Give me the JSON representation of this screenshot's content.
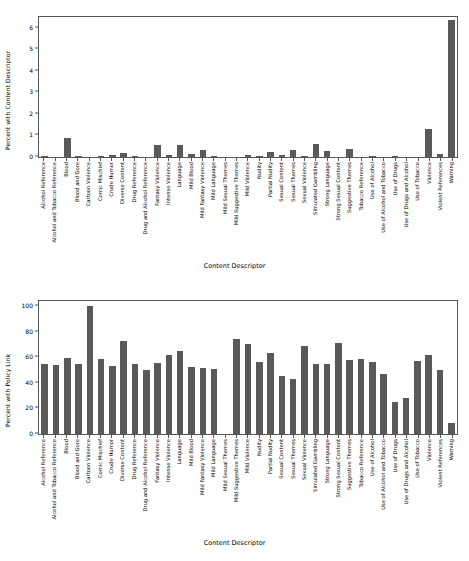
{
  "figure": {
    "categories": [
      "Alcohol Reference",
      "Alcohol and Tobacco Reference",
      "Blood",
      "Blood and Gore",
      "Cartoon Violence",
      "Comic Mischief",
      "Crude Humor",
      "Diverse Content",
      "Drug Reference",
      "Drug and Alcohol Reference",
      "Fantasy Violence",
      "Intense Violence",
      "Language",
      "Mild Blood",
      "Mild Fantasy Violence",
      "Mild Language",
      "Mild Sexual Themes",
      "Mild Suggestive Themes",
      "Mild Violence",
      "Nudity",
      "Partial Nudity",
      "Sexual Content",
      "Sexual Themes",
      "Sexual Violence",
      "Simulated Gambling",
      "Strong Language",
      "Strong Sexual Content",
      "Suggestive Themes",
      "Tobacco Reference",
      "Use of Alcohol",
      "Use of Alcohol and Tobacco",
      "Use of Drugs",
      "Use of Drugs and Alcohol",
      "Use of Tobacco",
      "Violence",
      "Violent References",
      "Warning"
    ],
    "xaxis_title": "Content Descriptor"
  },
  "chart_data": [
    {
      "type": "bar",
      "title": "",
      "xlabel": "Content Descriptor",
      "ylabel": "Percent with Content Descriptor",
      "ylim": [
        0,
        6.5
      ],
      "yticks": [
        0,
        1,
        2,
        3,
        4,
        5,
        6
      ],
      "grid": false,
      "bar_color": "#595959",
      "categories": [
        "Alcohol Reference",
        "Alcohol and Tobacco Reference",
        "Blood",
        "Blood and Gore",
        "Cartoon Violence",
        "Comic Mischief",
        "Crude Humor",
        "Diverse Content",
        "Drug Reference",
        "Drug and Alcohol Reference",
        "Fantasy Violence",
        "Intense Violence",
        "Language",
        "Mild Blood",
        "Mild Fantasy Violence",
        "Mild Language",
        "Mild Sexual Themes",
        "Mild Suggestive Themes",
        "Mild Violence",
        "Nudity",
        "Partial Nudity",
        "Sexual Content",
        "Sexual Themes",
        "Sexual Violence",
        "Simulated Gambling",
        "Strong Language",
        "Strong Sexual Content",
        "Suggestive Themes",
        "Tobacco Reference",
        "Use of Alcohol",
        "Use of Alcohol and Tobacco",
        "Use of Drugs",
        "Use of Drugs and Alcohol",
        "Use of Tobacco",
        "Violence",
        "Violent References",
        "Warning"
      ],
      "values": [
        0.04,
        0.02,
        0.9,
        0.07,
        0.02,
        0.04,
        0.11,
        0.17,
        0.07,
        0.02,
        0.55,
        0.09,
        0.57,
        0.15,
        0.31,
        0.03,
        0.02,
        0.02,
        0.09,
        0.03,
        0.22,
        0.11,
        0.32,
        0.03,
        0.62,
        0.27,
        0.02,
        0.35,
        0.02,
        0.05,
        0.02,
        0.04,
        0.02,
        0.02,
        1.3,
        0.15,
        6.35
      ]
    },
    {
      "type": "bar",
      "title": "",
      "xlabel": "Content Descriptor",
      "ylabel": "Percent with Policy Link",
      "ylim": [
        0,
        104
      ],
      "yticks": [
        0,
        20,
        40,
        60,
        80,
        100
      ],
      "grid": false,
      "bar_color": "#595959",
      "categories": [
        "Alcohol Reference",
        "Alcohol and Tobacco Reference",
        "Blood",
        "Blood and Gore",
        "Cartoon Violence",
        "Comic Mischief",
        "Crude Humor",
        "Diverse Content",
        "Drug Reference",
        "Drug and Alcohol Reference",
        "Fantasy Violence",
        "Intense Violence",
        "Language",
        "Mild Blood",
        "Mild Fantasy Violence",
        "Mild Language",
        "Mild Sexual Themes",
        "Mild Suggestive Themes",
        "Mild Violence",
        "Nudity",
        "Partial Nudity",
        "Sexual Content",
        "Sexual Themes",
        "Sexual Violence",
        "Simulated Gambling",
        "Strong Language",
        "Strong Sexual Content",
        "Suggestive Themes",
        "Tobacco Reference",
        "Use of Alcohol",
        "Use of Alcohol and Tobacco",
        "Use of Drugs",
        "Use of Drugs and Alcohol",
        "Use of Tobacco",
        "Violence",
        "Violent References",
        "Warning"
      ],
      "values": [
        54.5,
        54.0,
        59.5,
        54.5,
        100.0,
        58.5,
        53.5,
        73.0,
        55.0,
        50.0,
        55.5,
        61.5,
        65.0,
        52.5,
        51.5,
        50.5,
        0.0,
        74.5,
        70.0,
        56.0,
        63.0,
        45.0,
        43.0,
        68.5,
        55.0,
        55.0,
        71.0,
        58.0,
        58.5,
        56.0,
        47.0,
        25.0,
        28.0,
        57.0,
        62.0,
        50.0,
        9.0
      ]
    }
  ]
}
